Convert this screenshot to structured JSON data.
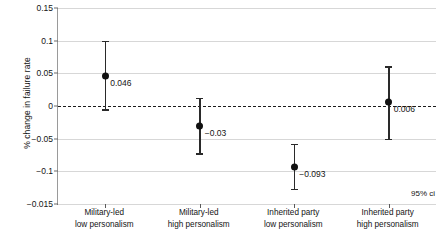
{
  "chart_data": {
    "type": "scatter",
    "title": "",
    "xlabel": "",
    "ylabel": "% change in failure rate",
    "ylim": [
      -0.015,
      0.15
    ],
    "grid": true,
    "legend": "none",
    "annotation": "95% ci",
    "zero_reference_line": 0,
    "y_ticks": [
      {
        "value": 0.15,
        "label": "0.15"
      },
      {
        "value": 0.1,
        "label": "0.1"
      },
      {
        "value": 0.05,
        "label": "0.05"
      },
      {
        "value": 0.0,
        "label": "0"
      },
      {
        "value": -0.05,
        "label": "−0.05"
      },
      {
        "value": -0.1,
        "label": "−0.1"
      },
      {
        "value": -0.015,
        "label": "−0.015"
      }
    ],
    "categories": [
      {
        "line1": "Military-led",
        "line2": "low personalism"
      },
      {
        "line1": "Military-led",
        "line2": "high personalism"
      },
      {
        "line1": "Inherited party",
        "line2": "low personalism"
      },
      {
        "line1": "Inherited party",
        "line2": "high personalism"
      }
    ],
    "points": [
      {
        "category": "Military-led low personalism",
        "estimate": 0.046,
        "label": "0.046",
        "ci_low": -0.005,
        "ci_high": 0.1
      },
      {
        "category": "Military-led high personalism",
        "estimate": -0.03,
        "label": "−0.03",
        "ci_low": -0.072,
        "ci_high": 0.013
      },
      {
        "category": "Inherited party low personalism",
        "estimate": -0.093,
        "label": "−0.093",
        "ci_low": -0.127,
        "ci_high": -0.058
      },
      {
        "category": "Inherited party high personalism",
        "estimate": 0.006,
        "label": "0.006",
        "ci_low": -0.05,
        "ci_high": 0.061
      }
    ],
    "colors": {
      "point": "#111111",
      "whisker": "#2a2a2a",
      "grid": "#d7d7d7",
      "zero_line": "#1c1c1c",
      "text": "#141414"
    }
  }
}
